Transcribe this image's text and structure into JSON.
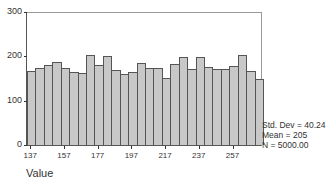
{
  "chart_data": {
    "type": "bar",
    "subtype": "histogram",
    "title": "",
    "xlabel": "Value",
    "ylabel": "",
    "ylim": [
      0,
      300
    ],
    "yticks": [
      0,
      100,
      200,
      300
    ],
    "xticks": [
      137,
      157,
      177,
      197,
      217,
      237,
      257
    ],
    "bin_width": 5,
    "bin_start": 134.5,
    "values": [
      168,
      174,
      180,
      188,
      174,
      164,
      163,
      204,
      181,
      200,
      170,
      161,
      165,
      184,
      173,
      174,
      152,
      182,
      198,
      172,
      198,
      176,
      172,
      172,
      178,
      204,
      166,
      148
    ],
    "grid": false,
    "legend": null,
    "annotations": {
      "std_dev": "Std. Dev = 40.24",
      "mean": "Mean = 205",
      "n": "N = 5000.00"
    }
  },
  "colors": {
    "bar_fill": "#c8c8c8",
    "bar_edge": "#555555",
    "background": "#ffffff"
  }
}
